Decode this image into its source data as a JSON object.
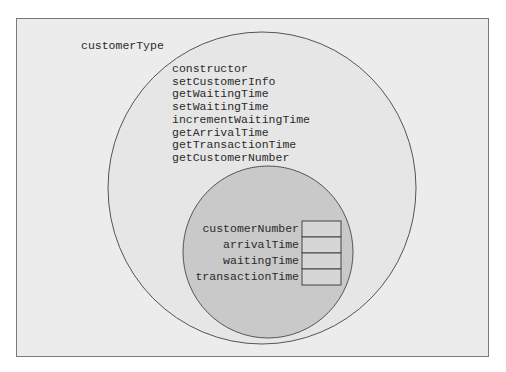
{
  "diagram": {
    "class_name": "customerType",
    "methods": [
      "constructor",
      "setCustomerInfo",
      "getWaitingTime",
      "setWaitingTime",
      "incrementWaitingTime",
      "getArrivalTime",
      "getTransactionTime",
      "getCustomerNumber"
    ],
    "members": [
      "customerNumber",
      "arrivalTime",
      "waitingTime",
      "transactionTime"
    ],
    "colors": {
      "background": "#ececec",
      "outer_circle_fill": "#e6e6e6",
      "inner_circle_fill": "#c9c9c9",
      "stroke": "#555555",
      "box_fill": "#d6d6d6"
    }
  }
}
